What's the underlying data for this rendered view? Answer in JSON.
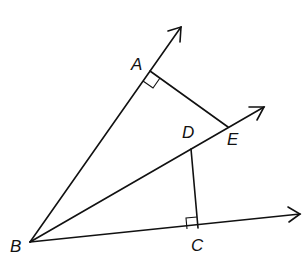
{
  "diagram": {
    "points": {
      "A": {
        "label": "A",
        "x": 150,
        "y": 71
      },
      "B": {
        "label": "B",
        "x": 30,
        "y": 242
      },
      "C": {
        "label": "C",
        "x": 198,
        "y": 228
      },
      "D": {
        "label": "D",
        "x": 191,
        "y": 149
      },
      "E": {
        "label": "E",
        "x": 228,
        "y": 127
      }
    },
    "rays": [
      {
        "from": "B",
        "through": "A",
        "tip": [
          181,
          27
        ]
      },
      {
        "from": "B",
        "through": "E",
        "tip": [
          264,
          107
        ]
      },
      {
        "from": "B",
        "through": "C",
        "tip": [
          300,
          214
        ]
      }
    ],
    "segments": [
      [
        "A",
        "E"
      ],
      [
        "D",
        "C"
      ]
    ],
    "right_angles": [
      "A",
      "C"
    ],
    "line_color": "#111111"
  }
}
